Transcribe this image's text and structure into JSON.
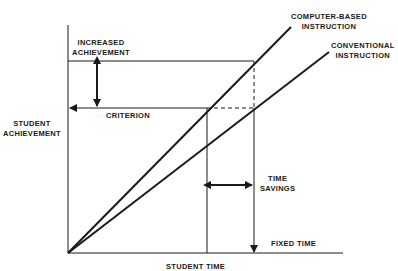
{
  "labels": {
    "increased_achievement": [
      "INCREASED",
      "ACHIEVEMENT"
    ],
    "criterion": "CRITERION",
    "student_achievement": [
      "STUDENT",
      "ACHIEVEMENT"
    ],
    "computer_based": [
      "COMPUTER-BASED",
      "INSTRUCTION"
    ],
    "conventional": [
      "CONVENTIONAL",
      "INSTRUCTION"
    ],
    "time_savings": [
      "TIME",
      "SAVINGS"
    ],
    "fixed_time": "FIXED TIME",
    "student_time": "STUDENT TIME"
  },
  "axes": {
    "x_label": "STUDENT TIME",
    "y_label": "STUDENT ACHIEVEMENT"
  },
  "series": [
    {
      "name": "COMPUTER-BASED INSTRUCTION",
      "slope_rank": "steeper"
    },
    {
      "name": "CONVENTIONAL INSTRUCTION",
      "slope_rank": "shallower"
    }
  ],
  "colors": {
    "ink": "#1a1a1a",
    "background": "#ffffff"
  }
}
